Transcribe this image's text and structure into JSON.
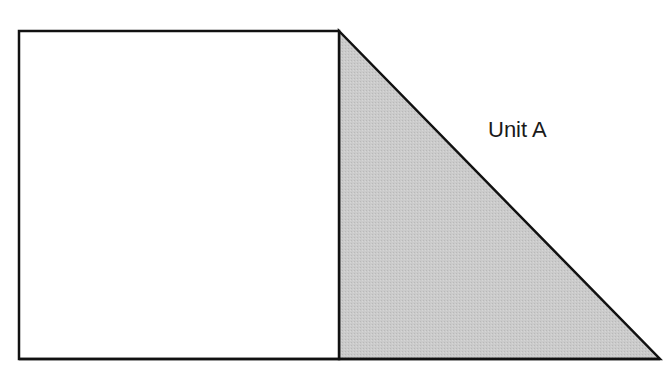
{
  "diagram": {
    "label": "Unit A",
    "colors": {
      "stroke": "#111111",
      "triangle_fill": "#c8c8c8",
      "square_fill": "#ffffff"
    }
  }
}
